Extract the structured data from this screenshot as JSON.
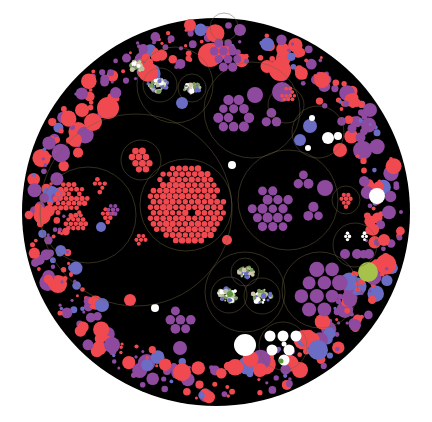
{
  "diagram": {
    "type": "circle-packing",
    "title": "",
    "palette": {
      "background": "#ffffff",
      "root": "#000000",
      "red": "#f04a50",
      "purple": "#8e4a9e",
      "blue": "#6b6cc4",
      "white": "#ffffff",
      "lime": "#a6c24a",
      "mixed": "#b8c0a0",
      "ring": "#6b6140"
    },
    "groups": [
      {
        "name": "big-red-cluster",
        "color": "red",
        "children": 3
      },
      {
        "name": "purple-cluster-center",
        "color": "purple",
        "children": 3
      },
      {
        "name": "purple-cluster-top",
        "color": "purple",
        "children": 3
      },
      {
        "name": "purple-cluster-bottom-right",
        "color": "purple",
        "children": 1
      },
      {
        "name": "mixed-cluster-top-left",
        "color": "mixed",
        "children": 3
      },
      {
        "name": "mixed-cluster-bottom",
        "color": "mixed",
        "children": 3
      },
      {
        "name": "white-cluster-right",
        "color": "white",
        "children": 2
      },
      {
        "name": "white-cluster-bottom",
        "color": "white",
        "children": 1
      },
      {
        "name": "outer-ring-bubbles",
        "color": "red",
        "children": 0
      }
    ]
  }
}
